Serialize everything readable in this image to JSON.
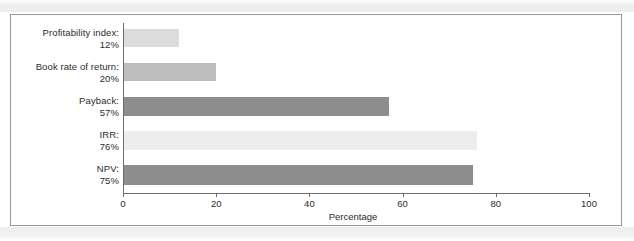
{
  "chart_data": {
    "type": "bar",
    "orientation": "horizontal",
    "title": "",
    "xlabel": "Percentage",
    "ylabel": "",
    "xlim": [
      0,
      100
    ],
    "xticks": [
      0,
      20,
      40,
      60,
      80,
      100
    ],
    "xtick_labels": [
      "0",
      "20",
      "40",
      "60",
      "80",
      "100"
    ],
    "grid": false,
    "legend": "none",
    "categories": [
      "Profitability index:",
      "Book rate of return:",
      "Payback:",
      "IRR:",
      "NPV:"
    ],
    "value_labels": [
      "12%",
      "20%",
      "57%",
      "76%",
      "75%"
    ],
    "values": [
      12,
      20,
      57,
      76,
      75
    ],
    "bar_colors": [
      "#dcdcdc",
      "#bdbdbd",
      "#8d8d8d",
      "#ededed",
      "#8d8d8d"
    ],
    "bars": [
      {
        "category": "Profitability index:",
        "value_label": "12%",
        "value": 12,
        "color": "#dcdcdc"
      },
      {
        "category": "Book rate of return:",
        "value_label": "20%",
        "value": 20,
        "color": "#bdbdbd"
      },
      {
        "category": "Payback:",
        "value_label": "57%",
        "value": 57,
        "color": "#8d8d8d"
      },
      {
        "category": "IRR:",
        "value_label": "76%",
        "value": 76,
        "color": "#ededed"
      },
      {
        "category": "NPV:",
        "value_label": "75%",
        "value": 75,
        "color": "#8d8d8d"
      }
    ]
  },
  "colors": {
    "axis": "#6e6e6e",
    "frame": "#9a9a9a",
    "text": "#2b2b2b",
    "background": "#ffffff"
  }
}
